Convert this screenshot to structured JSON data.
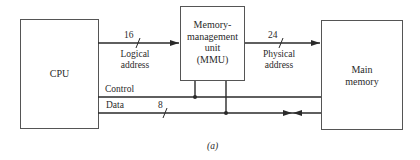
{
  "figure": {
    "caption": "(a)",
    "blocks": {
      "cpu": {
        "label": "CPU"
      },
      "mmu": {
        "line1": "Memory-",
        "line2": "management",
        "line3": "unit",
        "line4": "(MMU)"
      },
      "memory": {
        "line1": "Main",
        "line2": "memory"
      }
    },
    "buses": {
      "logical": {
        "width": "16",
        "label_line1": "Logical",
        "label_line2": "address"
      },
      "physical": {
        "width": "24",
        "label_line1": "Physical",
        "label_line2": "address"
      },
      "control": {
        "label": "Control"
      },
      "data": {
        "label": "Data",
        "width": "8"
      }
    },
    "colors": {
      "stroke": "#2a2a2a",
      "background": "#ffffff"
    }
  }
}
